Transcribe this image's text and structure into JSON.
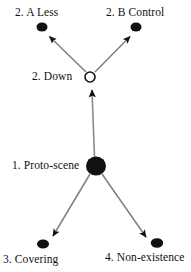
{
  "diagram": {
    "type": "radial-network-diagram",
    "background_color": "#ffffff",
    "edge_color": "#7a7a7a",
    "arrowhead_color": "#111111",
    "node_fill_color": "#111111",
    "hollow_node_fill_color": "#ffffff",
    "hollow_node_stroke_color": "#111111",
    "nodes": [
      {
        "id": "a-less",
        "label": "2. A Less",
        "style": "filled-dot",
        "cx": 42,
        "cy": 27,
        "rx": 5.5,
        "ry": 4.5,
        "label_x": 15,
        "label_y": 6
      },
      {
        "id": "b-control",
        "label": "2. B Control",
        "style": "filled-dot",
        "cx": 136,
        "cy": 27,
        "rx": 5.5,
        "ry": 4.5,
        "label_x": 106,
        "label_y": 6
      },
      {
        "id": "down",
        "label": "2. Down",
        "style": "hollow-circle",
        "cx": 90,
        "cy": 77,
        "rx": 5,
        "ry": 5,
        "label_x": 32,
        "label_y": 70
      },
      {
        "id": "proto-scene",
        "label": "1. Proto-scene",
        "style": "filled-large-circle",
        "cx": 96,
        "cy": 166,
        "rx": 10,
        "ry": 9.5,
        "label_x": 12,
        "label_y": 159
      },
      {
        "id": "covering",
        "label": "3. Covering",
        "style": "filled-dot",
        "cx": 43,
        "cy": 244,
        "rx": 6,
        "ry": 4.5,
        "label_x": 3,
        "label_y": 253
      },
      {
        "id": "non-existence",
        "label": "4. Non-existence",
        "style": "filled-dot",
        "cx": 157,
        "cy": 243,
        "rx": 6,
        "ry": 4.5,
        "label_x": 105,
        "label_y": 251
      }
    ],
    "edges": [
      {
        "id": "proto-scene-to-down",
        "from": "proto-scene",
        "to": "down",
        "direction": "up",
        "x1": 94,
        "y1": 157,
        "x2": 92,
        "y2": 86
      },
      {
        "id": "down-to-a-less",
        "from": "down",
        "to": "a-less",
        "direction": "up-left",
        "x1": 86,
        "y1": 72,
        "x2": 47,
        "y2": 34
      },
      {
        "id": "down-to-b-control",
        "from": "down",
        "to": "b-control",
        "direction": "up-right",
        "x1": 95,
        "y1": 72,
        "x2": 132,
        "y2": 34
      },
      {
        "id": "proto-scene-to-covering",
        "from": "proto-scene",
        "to": "covering",
        "direction": "down-left",
        "x1": 90,
        "y1": 175,
        "x2": 51,
        "y2": 238
      },
      {
        "id": "proto-scene-to-non-existence",
        "from": "proto-scene",
        "to": "non-existence",
        "direction": "down-right",
        "x1": 102,
        "y1": 175,
        "x2": 148,
        "y2": 238
      }
    ]
  }
}
